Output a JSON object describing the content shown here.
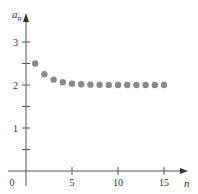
{
  "chart_data": {
    "type": "scatter",
    "title": "",
    "xlabel": "n",
    "ylabel": "a",
    "ylabel_subscript": "n",
    "xlim": [
      0,
      16
    ],
    "ylim": [
      -0.3,
      3.4
    ],
    "x_ticks": [
      5,
      10,
      15
    ],
    "x_tick_labels": [
      "5",
      "10",
      "15"
    ],
    "y_ticks": [
      0.5,
      1,
      1.5,
      2,
      2.5,
      3
    ],
    "y_tick_labels": [
      "",
      "1",
      "",
      "2",
      "",
      "3"
    ],
    "origin_label": "0",
    "grid": false,
    "legend": "none",
    "series": [
      {
        "name": "a_n",
        "x": [
          1,
          2,
          3,
          4,
          5,
          6,
          7,
          8,
          9,
          10,
          11,
          12,
          13,
          14,
          15
        ],
        "y": [
          2.5,
          2.25,
          2.125,
          2.0625,
          2.03125,
          2.016,
          2.008,
          2.004,
          2.002,
          2.001,
          2.0005,
          2.0002,
          2.0001,
          2.0001,
          2.0
        ]
      }
    ]
  }
}
